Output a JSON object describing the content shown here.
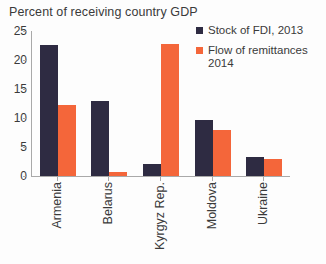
{
  "chart_data": {
    "type": "bar",
    "title": "Percent of receiving country GDP",
    "xlabel": "",
    "ylabel": "",
    "ylim": [
      0,
      25
    ],
    "yticks": [
      0,
      5,
      10,
      15,
      20,
      25
    ],
    "grid": false,
    "legend_position": "top-right",
    "categories": [
      "Armenia",
      "Belarus",
      "Kyrgyz Rep.",
      "Moldova",
      "Ukraine"
    ],
    "series": [
      {
        "name": "Stock of FDI, 2013",
        "color": "#2e2b42",
        "values": [
          22.6,
          13.0,
          2.1,
          9.7,
          3.3
        ]
      },
      {
        "name": "Flow of remittances\n2014",
        "color": "#f4663a",
        "values": [
          12.2,
          0.7,
          22.8,
          8.0,
          2.9
        ]
      }
    ]
  },
  "colors": {
    "series_1": "#2e2b42",
    "series_2": "#f4663a",
    "axis": "#a9a9a9",
    "text": "#3a3a3a",
    "background": "#fdfdfd"
  }
}
